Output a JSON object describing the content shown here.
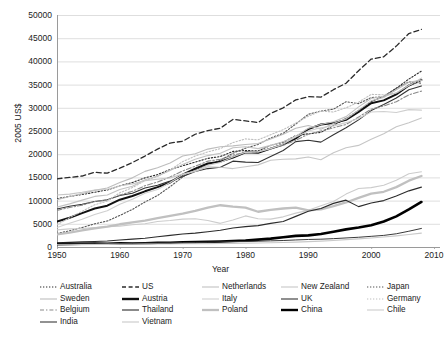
{
  "axes": {
    "ylabel": "2005 US$",
    "xlabel": "Year",
    "yticks": [
      "50000",
      "45000",
      "40000",
      "35000",
      "30000",
      "25000",
      "20000",
      "15000",
      "10000",
      "5000",
      "0"
    ],
    "xticks": [
      "1950",
      "1960",
      "1970",
      "1980",
      "1990",
      "2000",
      "2010"
    ]
  },
  "legend": {
    "columns": [
      {
        "items": [
          {
            "label": "Australia",
            "style": "dotted-fine",
            "color": "#2b2b2b"
          },
          {
            "label": "Sweden",
            "style": "solid-light",
            "color": "#bdbdbd"
          },
          {
            "label": "Belgium",
            "style": "dash-dot",
            "color": "#8a8a8a"
          },
          {
            "label": "India",
            "style": "solid-thin",
            "color": "#3a3a3a"
          }
        ]
      },
      {
        "items": [
          {
            "label": "US",
            "style": "dashed",
            "color": "#2b2b2b"
          },
          {
            "label": "Austria",
            "style": "solid-bold",
            "color": "#111111"
          },
          {
            "label": "Thailand",
            "style": "solid-thin",
            "color": "#2b2b2b"
          },
          {
            "label": "Vietnam",
            "style": "solid-light",
            "color": "#c9c9c9"
          }
        ]
      },
      {
        "items": [
          {
            "label": "Netherlands",
            "style": "solid-light",
            "color": "#c2c2c2"
          },
          {
            "label": "Italy",
            "style": "solid-light",
            "color": "#cfcfcf"
          },
          {
            "label": "Poland",
            "style": "solid-gray-bold",
            "color": "#c0c0c0"
          }
        ]
      },
      {
        "items": [
          {
            "label": "New Zealand",
            "style": "solid-light",
            "color": "#c6c6c6"
          },
          {
            "label": "UK",
            "style": "solid-thin",
            "color": "#333333"
          },
          {
            "label": "China",
            "style": "solid-bold",
            "color": "#000000"
          }
        ]
      },
      {
        "items": [
          {
            "label": "Japan",
            "style": "dotted-fine",
            "color": "#555555"
          },
          {
            "label": "Germany",
            "style": "dotted-light",
            "color": "#bfbfbf"
          },
          {
            "label": "Chile",
            "style": "solid-light",
            "color": "#cccccc"
          }
        ]
      }
    ]
  },
  "fragment_top_right": "",
  "chart_data": {
    "type": "line",
    "title": "",
    "xlabel": "Year",
    "ylabel": "2005 US$",
    "xlim": [
      1950,
      2010
    ],
    "ylim": [
      0,
      50000
    ],
    "ytick_step": 5000,
    "xtick_step": 10,
    "grid": "horizontal",
    "legend_position": "bottom",
    "x": [
      1950,
      1952,
      1954,
      1956,
      1958,
      1960,
      1962,
      1964,
      1966,
      1968,
      1970,
      1972,
      1974,
      1976,
      1978,
      1980,
      1982,
      1984,
      1986,
      1988,
      1990,
      1992,
      1994,
      1996,
      1998,
      2000,
      2002,
      2004,
      2006,
      2008
    ],
    "series": [
      {
        "name": "US",
        "style": "dashed",
        "color": "#2b2b2b",
        "width": 1.3,
        "values": [
          14700,
          15000,
          15300,
          16100,
          15900,
          17000,
          18200,
          19600,
          21100,
          22400,
          22800,
          24300,
          25100,
          25600,
          27500,
          27200,
          26800,
          28800,
          30000,
          31700,
          32400,
          32300,
          33900,
          35300,
          38000,
          40500,
          41000,
          43300,
          46000,
          46900
        ]
      },
      {
        "name": "Australia",
        "style": "dotted",
        "color": "#2b2b2b",
        "width": 1.1,
        "values": [
          10400,
          10900,
          11300,
          11800,
          12300,
          13200,
          13900,
          14900,
          15600,
          16700,
          17500,
          18300,
          19100,
          19500,
          20600,
          20800,
          20700,
          21900,
          22600,
          24000,
          24400,
          24700,
          26200,
          27700,
          29400,
          31300,
          32500,
          34200,
          36200,
          37900
        ]
      },
      {
        "name": "Japan",
        "style": "dotted",
        "color": "#555555",
        "width": 1.1,
        "values": [
          2900,
          3500,
          4200,
          5000,
          5600,
          6800,
          8100,
          9700,
          11100,
          13000,
          15100,
          16600,
          17700,
          18700,
          20200,
          21300,
          22100,
          23500,
          24500,
          26500,
          28600,
          29300,
          29700,
          31300,
          30900,
          32200,
          32400,
          34200,
          35600,
          35300
        ]
      },
      {
        "name": "Austria",
        "style": "solid",
        "color": "#111111",
        "width": 2.0,
        "values": [
          5500,
          6300,
          7300,
          8300,
          8900,
          10200,
          11000,
          12000,
          12900,
          13900,
          15600,
          16900,
          18000,
          18400,
          19300,
          20400,
          20300,
          21200,
          22100,
          23400,
          25400,
          26400,
          26700,
          27400,
          29100,
          31000,
          31600,
          32900,
          34800,
          36000
        ]
      },
      {
        "name": "UK",
        "style": "solid",
        "color": "#333333",
        "width": 1.1,
        "values": [
          8200,
          8800,
          9200,
          9800,
          10200,
          11100,
          11600,
          12700,
          13300,
          14200,
          15200,
          16300,
          16900,
          17200,
          18500,
          18300,
          18200,
          19500,
          20800,
          22700,
          23000,
          22600,
          24200,
          25700,
          27400,
          29400,
          30700,
          32100,
          33900,
          34700
        ]
      },
      {
        "name": "Netherlands",
        "style": "solid",
        "color": "#c2c2c2",
        "width": 1.1,
        "values": [
          8600,
          9300,
          10100,
          10900,
          11200,
          12400,
          13100,
          14500,
          15300,
          16500,
          17800,
          18900,
          19700,
          20200,
          21400,
          21600,
          21200,
          21900,
          22700,
          23900,
          25600,
          26400,
          27000,
          28100,
          30200,
          32000,
          32500,
          33200,
          34800,
          36400
        ]
      },
      {
        "name": "Sweden",
        "style": "solid",
        "color": "#bdbdbd",
        "width": 1.1,
        "values": [
          10200,
          10900,
          11500,
          12200,
          12700,
          13900,
          14900,
          16300,
          17100,
          18100,
          19600,
          20100,
          21100,
          21600,
          21800,
          22100,
          22300,
          23300,
          24300,
          25600,
          26200,
          25400,
          26600,
          27600,
          29500,
          31500,
          32200,
          33900,
          35500,
          36000
        ]
      },
      {
        "name": "Belgium",
        "style": "dashdot",
        "color": "#8a8a8a",
        "width": 1.1,
        "values": [
          7900,
          8500,
          9000,
          9800,
          10100,
          11200,
          12000,
          13200,
          14000,
          15100,
          16400,
          17400,
          18500,
          18900,
          19800,
          20400,
          20500,
          21300,
          21900,
          23000,
          24300,
          25000,
          25700,
          26400,
          28000,
          29700,
          30400,
          31300,
          32800,
          33600
        ]
      },
      {
        "name": "Germany",
        "style": "dotted",
        "color": "#bfbfbf",
        "width": 1.1,
        "values": [
          4800,
          6300,
          7700,
          9100,
          9900,
          11700,
          12800,
          14300,
          15200,
          16600,
          18400,
          19600,
          20500,
          21200,
          22500,
          23300,
          23100,
          24200,
          25300,
          26700,
          28200,
          29300,
          29100,
          30000,
          31200,
          32900,
          32800,
          33200,
          34900,
          35900
        ]
      },
      {
        "name": "Italy",
        "style": "solid",
        "color": "#cfcfcf",
        "width": 1.1,
        "values": [
          4200,
          5100,
          6000,
          7000,
          7800,
          9200,
          10300,
          11600,
          12400,
          13900,
          15600,
          16400,
          17600,
          18200,
          19400,
          20400,
          20500,
          21200,
          22200,
          23700,
          25000,
          25700,
          26100,
          26800,
          27700,
          29100,
          29200,
          29000,
          29600,
          29500
        ]
      },
      {
        "name": "New Zealand",
        "style": "solid",
        "color": "#c6c6c6",
        "width": 1.1,
        "values": [
          11200,
          11400,
          11800,
          12300,
          12400,
          13200,
          13600,
          14300,
          14600,
          14900,
          15700,
          16300,
          17300,
          17200,
          16900,
          17300,
          17700,
          18700,
          18900,
          19000,
          19400,
          18800,
          20300,
          21400,
          21900,
          23200,
          24400,
          25900,
          26800,
          27800
        ]
      },
      {
        "name": "Chile",
        "style": "solid",
        "color": "#cccccc",
        "width": 1.1,
        "values": [
          3700,
          3900,
          4000,
          4200,
          4400,
          4500,
          4800,
          5000,
          5500,
          5700,
          6000,
          6100,
          5700,
          5100,
          5800,
          6700,
          6100,
          6000,
          6500,
          7300,
          7900,
          8900,
          9800,
          11400,
          12600,
          12800,
          13300,
          14400,
          15800,
          16200
        ]
      },
      {
        "name": "Poland",
        "style": "solid",
        "color": "#c0c0c0",
        "width": 2.3,
        "values": [
          2700,
          3100,
          3600,
          4000,
          4400,
          4900,
          5300,
          5700,
          6200,
          6700,
          7200,
          7800,
          8500,
          9000,
          8700,
          8500,
          7600,
          8000,
          8300,
          8500,
          7900,
          8100,
          8800,
          9600,
          10600,
          11500,
          11900,
          12900,
          14300,
          15300
        ]
      },
      {
        "name": "Thailand",
        "style": "solid",
        "color": "#2b2b2b",
        "width": 1.1,
        "values": [
          900,
          1000,
          1100,
          1200,
          1300,
          1500,
          1700,
          1900,
          2200,
          2500,
          2800,
          3000,
          3300,
          3600,
          4100,
          4400,
          4600,
          5100,
          5500,
          6600,
          7700,
          8300,
          9400,
          10100,
          8700,
          9500,
          10000,
          11000,
          12100,
          12900
        ]
      },
      {
        "name": "China",
        "style": "solid",
        "color": "#000000",
        "width": 2.6,
        "values": [
          620,
          640,
          700,
          760,
          700,
          800,
          750,
          820,
          900,
          930,
          1000,
          1050,
          1100,
          1200,
          1300,
          1400,
          1600,
          1800,
          2100,
          2400,
          2500,
          2800,
          3300,
          3800,
          4200,
          4700,
          5500,
          6600,
          8100,
          9700
        ]
      },
      {
        "name": "India",
        "style": "solid",
        "color": "#3a3a3a",
        "width": 1.0,
        "values": [
          600,
          630,
          670,
          700,
          720,
          780,
          790,
          830,
          850,
          900,
          960,
          980,
          1020,
          1080,
          1150,
          1180,
          1250,
          1330,
          1400,
          1520,
          1620,
          1680,
          1800,
          1950,
          2100,
          2300,
          2500,
          2850,
          3400,
          4000
        ]
      },
      {
        "name": "Vietnam",
        "style": "solid",
        "color": "#c9c9c9",
        "width": 1.1,
        "values": [
          480,
          500,
          520,
          540,
          560,
          580,
          600,
          620,
          640,
          660,
          690,
          710,
          730,
          760,
          790,
          830,
          870,
          920,
          980,
          1060,
          1150,
          1260,
          1400,
          1580,
          1760,
          1950,
          2150,
          2400,
          2700,
          3000
        ]
      }
    ]
  }
}
